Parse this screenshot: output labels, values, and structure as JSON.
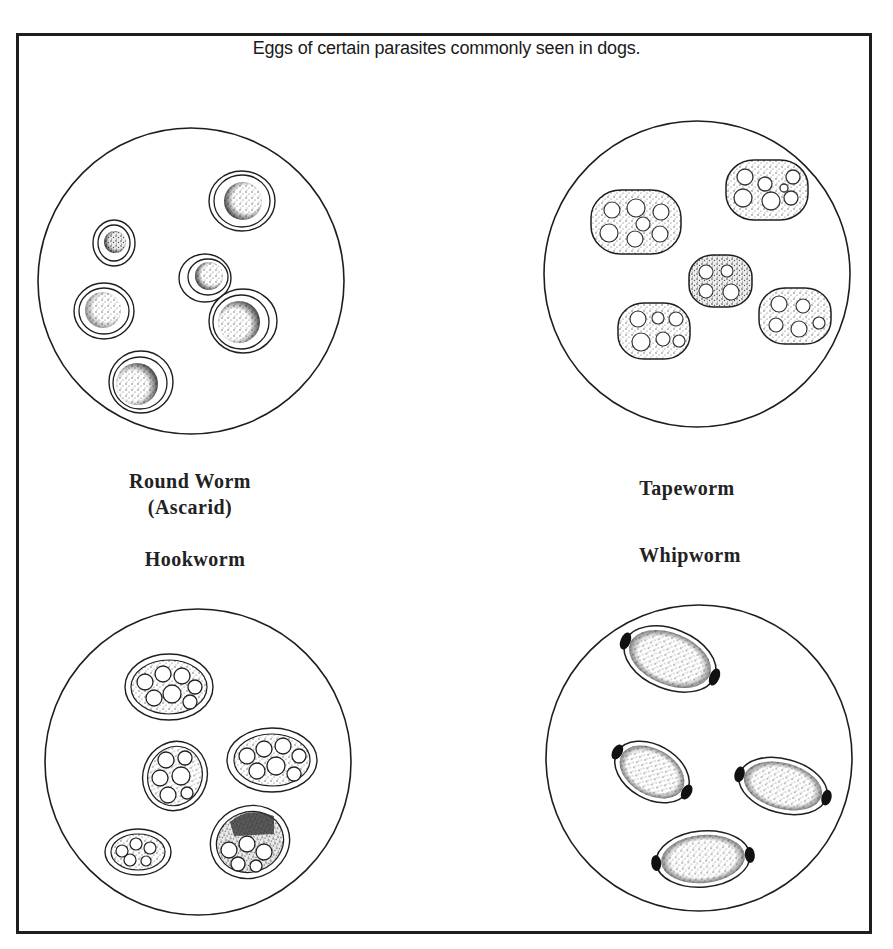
{
  "figure": {
    "title": "Eggs of certain parasites commonly seen in dogs.",
    "panels": [
      {
        "id": "roundworm",
        "label_line1": "Round Worm",
        "label_line2": "(Ascarid)",
        "egg_count": 6,
        "position": "top-left"
      },
      {
        "id": "tapeworm",
        "label_line1": "Tapeworm",
        "egg_count": 5,
        "position": "top-right"
      },
      {
        "id": "hookworm",
        "label_line1": "Hookworm",
        "egg_count": 5,
        "position": "bottom-left"
      },
      {
        "id": "whipworm",
        "label_line1": "Whipworm",
        "egg_count": 4,
        "position": "bottom-right"
      }
    ]
  },
  "colors": {
    "ink": "#1e1e1e",
    "background": "#ffffff",
    "stipple": "#555555"
  }
}
